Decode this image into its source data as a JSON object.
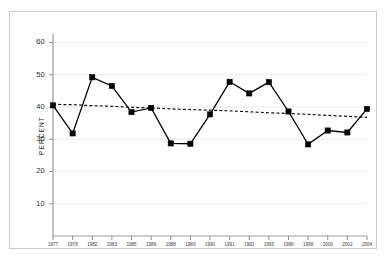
{
  "chart_data": {
    "type": "line",
    "title": "",
    "xlabel": "",
    "ylabel": "PERCENT",
    "ylim": [
      0,
      62
    ],
    "yticks": [
      10,
      20,
      30,
      40,
      50,
      60
    ],
    "ytick_labels": [
      "10",
      "20",
      "30",
      "40",
      "50",
      "60"
    ],
    "grid": true,
    "grid_axis": "y",
    "legend": false,
    "categories": [
      "1977",
      "1978",
      "1982",
      "1983",
      "1985",
      "1986",
      "1988",
      "1989",
      "1990",
      "1991",
      "1993",
      "1995",
      "1996",
      "1998",
      "2000",
      "2002",
      "2004"
    ],
    "series": [
      {
        "name": "percent",
        "type": "line",
        "marker": "square",
        "color": "#000000",
        "linestyle": "solid",
        "values": [
          40.5,
          31.8,
          49.2,
          46.5,
          38.4,
          39.7,
          28.7,
          28.6,
          37.7,
          47.8,
          44.2,
          47.7,
          38.6,
          28.4,
          32.7,
          32.1,
          39.4
        ]
      },
      {
        "name": "trend",
        "type": "line",
        "marker": "none",
        "color": "#111111",
        "linestyle": "dashed",
        "values": [
          40.8,
          40.7,
          40.4,
          40.2,
          39.9,
          39.7,
          39.4,
          39.2,
          39.0,
          38.8,
          38.5,
          38.2,
          38.0,
          37.7,
          37.4,
          37.1,
          36.8
        ]
      }
    ]
  },
  "figure": {
    "background": "#ffffff",
    "frame_color": "#c9c9c9",
    "axis_color": "#9a9a9a",
    "grid_color": "#ebebeb",
    "tick_color": "#8f8f8f",
    "text_color": "#2b2b2b"
  }
}
